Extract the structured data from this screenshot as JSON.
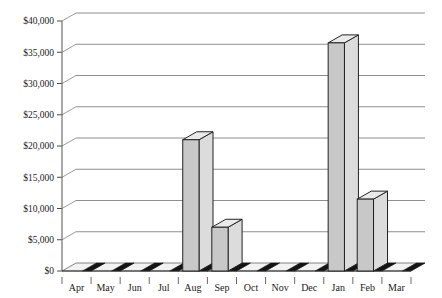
{
  "chart_data": {
    "type": "bar",
    "title": "",
    "xlabel": "",
    "ylabel": "",
    "categories": [
      "Apr",
      "May",
      "Jun",
      "Jul",
      "Aug",
      "Sep",
      "Oct",
      "Nov",
      "Dec",
      "Jan",
      "Feb",
      "Mar"
    ],
    "values": [
      0,
      0,
      0,
      0,
      21000,
      7000,
      0,
      0,
      0,
      36500,
      11500,
      0
    ],
    "ylim": [
      0,
      40000
    ],
    "ytick_values": [
      0,
      5000,
      10000,
      15000,
      20000,
      25000,
      30000,
      35000,
      40000
    ],
    "ytick_labels": [
      "$0",
      "$5,000",
      "$10,000",
      "$15,000",
      "$20,000",
      "$25,000",
      "$30,000",
      "$35,000",
      "$40,000"
    ],
    "grid": true,
    "legend": "none",
    "style": "3d-column-grayscale",
    "series": [
      {
        "name": "Amount",
        "values": [
          0,
          0,
          0,
          0,
          21000,
          7000,
          0,
          0,
          0,
          36500,
          11500,
          0
        ]
      }
    ]
  },
  "colors": {
    "bar_front": "#c8c8c8",
    "bar_side": "#dcdcdc",
    "bar_top": "#eaeaea",
    "bar_outline": "#232323",
    "gridline": "#8e8e8e",
    "axis": "#6f6f6f",
    "text": "#1a1a1a",
    "background": "#ffffff",
    "floor_dark": "#141414",
    "floor_light": "#f2f2f2"
  }
}
